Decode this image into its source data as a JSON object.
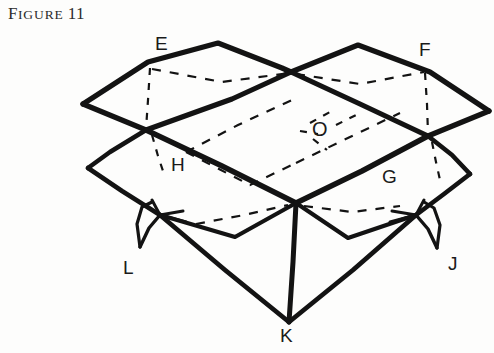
{
  "caption": {
    "first_letter": "F",
    "small_caps": "IGURE",
    "number": "11",
    "full": "FIGURE 11"
  },
  "figure": {
    "ink_color": "#131313",
    "paper_color": "#fdfdfc",
    "labels": [
      {
        "id": "E",
        "text": "E",
        "x": 155,
        "y": 35
      },
      {
        "id": "F",
        "text": "F",
        "x": 419,
        "y": 41
      },
      {
        "id": "O",
        "text": "O",
        "x": 312,
        "y": 120
      },
      {
        "id": "H",
        "text": "H",
        "x": 171,
        "y": 156
      },
      {
        "id": "G",
        "text": "G",
        "x": 382,
        "y": 168
      },
      {
        "id": "L",
        "text": "L",
        "x": 122,
        "y": 259
      },
      {
        "id": "J",
        "text": "J",
        "x": 447,
        "y": 255
      },
      {
        "id": "K",
        "text": "K",
        "x": 279,
        "y": 327
      }
    ],
    "vertices": {
      "E_apex": [
        218,
        43
      ],
      "F_apex": [
        358,
        45
      ],
      "left_outer_top": [
        83,
        104
      ],
      "right_outer_top": [
        489,
        111
      ],
      "center_top_cross": [
        291,
        72
      ],
      "left_mid_cross": [
        146,
        130
      ],
      "right_mid_cross": [
        428,
        136
      ],
      "left_outer_lower": [
        88,
        168
      ],
      "right_outer_lower": [
        470,
        174
      ],
      "center_ridge": [
        296,
        203
      ],
      "L_flap_tip": [
        160,
        215
      ],
      "J_flap_tip": [
        416,
        215
      ],
      "K_bottom": [
        289,
        322
      ]
    },
    "stroke_widths": {
      "heavy": 5.5,
      "medium": 4.2,
      "light": 3.0,
      "dashed": 2.2
    }
  }
}
